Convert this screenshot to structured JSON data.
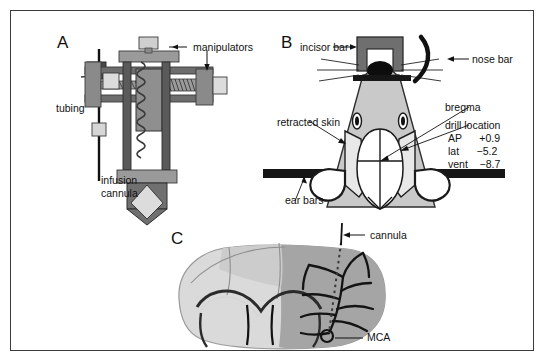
{
  "figure": {
    "background": "#ffffff",
    "border_color": "#3b3b3b",
    "palette": {
      "mid_gray": "#8a8a8a",
      "dark_gray": "#555555",
      "light_gray": "#c9c9c9",
      "pale_gray": "#d6d6d6",
      "brain_light": "#d9d9d9",
      "brain_dark": "#9e9e9e",
      "black": "#111111",
      "white": "#ffffff"
    }
  },
  "panels": [
    {
      "id": "A",
      "letter": "A",
      "title": "stereotaxic manipulator assembly",
      "labels": [
        {
          "name": "manipulators",
          "text": "manipulators"
        },
        {
          "name": "tubing",
          "text": "tubing"
        },
        {
          "name": "infusion-cannula",
          "text": "infusion\ncannula"
        },
        {
          "name": "infusion-cannula-line1",
          "text": "infusion"
        },
        {
          "name": "infusion-cannula-line2",
          "text": "cannula"
        }
      ]
    },
    {
      "id": "B",
      "letter": "B",
      "title": "rat head in stereotaxic frame, dorsal view",
      "labels": [
        {
          "name": "incisor-bar",
          "text": "incisor bar"
        },
        {
          "name": "nose-bar",
          "text": "nose bar"
        },
        {
          "name": "bregma",
          "text": "bregma"
        },
        {
          "name": "drill-location",
          "text": "drill location"
        },
        {
          "name": "retracted-skin",
          "text": "retracted skin"
        },
        {
          "name": "ear-bars",
          "text": "ear bars"
        }
      ],
      "coordinates": {
        "title": "drill location",
        "rows": [
          {
            "axis": "AP",
            "value": "+0.9"
          },
          {
            "axis": "lat",
            "value": "−5.2"
          },
          {
            "axis": "vent",
            "value": "−8.7"
          }
        ],
        "ap_line": "AP      +0.9",
        "lat_line": "lat      −5.2",
        "vent_line": "vent    −8.7"
      }
    },
    {
      "id": "C",
      "letter": "C",
      "title": "coronal brain section with MCA and cannula track",
      "labels": [
        {
          "name": "cannula",
          "text": "cannula"
        },
        {
          "name": "mca",
          "text": "MCA"
        }
      ]
    }
  ]
}
